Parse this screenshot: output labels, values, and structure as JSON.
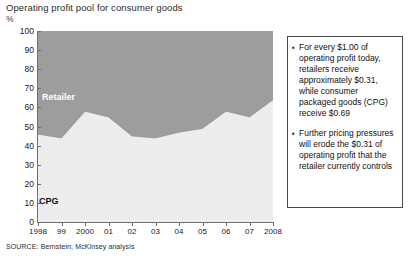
{
  "header": {
    "title": "Operating profit pool for consumer goods",
    "unit": "%"
  },
  "source": {
    "text": "SOURCE: Bernstein; McKinsey analysis"
  },
  "callout": {
    "bullet_mark": "▪",
    "bullets": [
      "For every $1.00 of operating profit today, retailers receive approximately $0.31, while consumer packaged goods (CPG) receive $0.69",
      "Further pricing pressures will erode the $0.31 of operating profit that the retailer currently controls"
    ]
  },
  "colors": {
    "retailer_band": "#9d9d9d",
    "cpg_band": "#ededed",
    "axis": "#6e6e6e",
    "callout_border": "#4a4a4a"
  },
  "chart_data": {
    "type": "area",
    "title": "Operating profit pool for consumer goods",
    "subtitle": "%",
    "xlabel": "",
    "ylabel": "%",
    "stacked": true,
    "grid": false,
    "legend": "in-plot",
    "ylim": [
      0,
      100
    ],
    "yticks": [
      0,
      10,
      20,
      30,
      40,
      50,
      60,
      70,
      80,
      90,
      100
    ],
    "ytick_labels": [
      "0",
      "10",
      "20",
      "30",
      "40",
      "50",
      "60",
      "70",
      "80",
      "90",
      "100"
    ],
    "x": [
      1998,
      1999,
      2000,
      2001,
      2002,
      2003,
      2004,
      2005,
      2006,
      2007,
      2008
    ],
    "xtick_labels": [
      "1998",
      "99",
      "2000",
      "01",
      "02",
      "03",
      "04",
      "05",
      "06",
      "07",
      "2008"
    ],
    "series": [
      {
        "name": "CPG",
        "color": "#ededed",
        "values": [
          46,
          44,
          58,
          55,
          45,
          44,
          47,
          49,
          58,
          55,
          64
        ]
      },
      {
        "name": "Retailer",
        "color": "#9d9d9d",
        "values": [
          54,
          56,
          42,
          45,
          55,
          56,
          53,
          51,
          42,
          45,
          36
        ]
      }
    ],
    "annotations": [
      {
        "label": "Retailer",
        "position": "upper-left"
      },
      {
        "label": "CPG",
        "position": "lower-left"
      }
    ]
  }
}
